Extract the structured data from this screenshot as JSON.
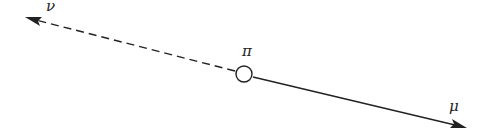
{
  "diagram": {
    "type": "particle-decay",
    "particles": {
      "parent": {
        "label": "π",
        "x": 244,
        "y": 74,
        "r": 8
      },
      "neutrino": {
        "label": "ν",
        "line_style": "dashed",
        "tip_x": 25,
        "tip_y": 17
      },
      "muon": {
        "label": "μ",
        "line_style": "solid",
        "tip_x": 467,
        "tip_y": 128
      }
    },
    "colors": {
      "stroke": "#222222",
      "background": "#ffffff"
    }
  }
}
